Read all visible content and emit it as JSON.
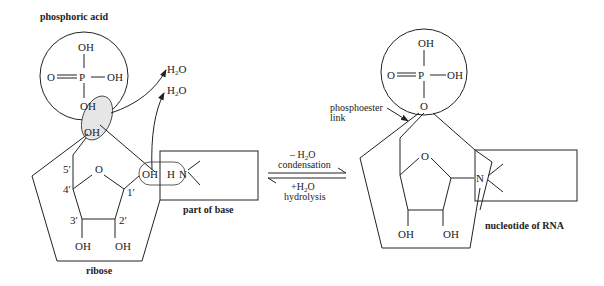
{
  "left": {
    "title": "phosphoric acid",
    "phosphate": {
      "top": "OH",
      "left": "O",
      "center": "P",
      "right": "OH",
      "bottom": "OH"
    },
    "sugar_oh": "OH",
    "ring_o": "O",
    "carbons": [
      "5′",
      "4′",
      "1′",
      "3′",
      "2′"
    ],
    "bottom_oh_3": "OH",
    "bottom_oh_2": "OH",
    "c1_oh": "OH",
    "base_h": "H",
    "base_n": "N",
    "base_label": "part of base",
    "sugar_label": "ribose",
    "water_1": "H",
    "water_1_sub": "2",
    "water_1_o": "O",
    "water_2": "H",
    "water_2_sub": "2",
    "water_2_o": "O"
  },
  "reaction": {
    "forward_top": "– H",
    "forward_top_sub": "2",
    "forward_top_o": "O",
    "forward_label": "condensation",
    "reverse_top": "+H",
    "reverse_top_sub": "2",
    "reverse_top_o": "O",
    "reverse_label": "hydrolysis"
  },
  "right": {
    "phosphate": {
      "top": "OH",
      "left": "O",
      "center": "P",
      "right": "OH",
      "bottom": "O"
    },
    "link_label_1": "phosphoester",
    "link_label_2": "link",
    "ring_o": "O",
    "base_n": "N",
    "bottom_oh_3": "OH",
    "bottom_oh_2": "OH",
    "label": "nucleotide of RNA"
  },
  "colors": {
    "line": "#222222",
    "highlight_fill": "#e6e6e6"
  }
}
